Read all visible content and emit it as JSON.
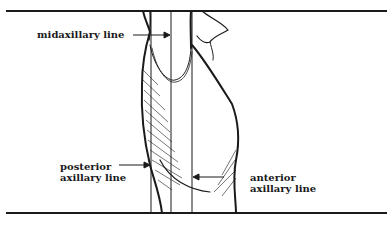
{
  "diagram": {
    "colors": {
      "ink": "#1a1a1a",
      "background": "#ffffff"
    },
    "labels": {
      "midaxillary": "midaxillary line",
      "posterior_line1": "posterior",
      "posterior_line2": "axillary line",
      "anterior_line1": "anterior",
      "anterior_line2": "axillary line"
    }
  }
}
